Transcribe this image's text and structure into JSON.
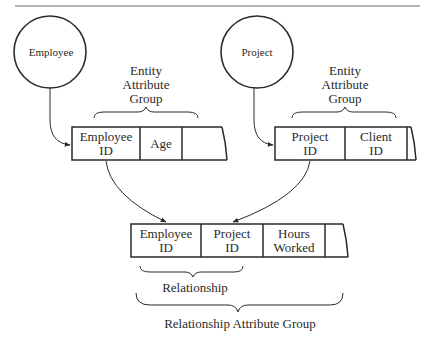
{
  "entities": [
    {
      "name": "Employee"
    },
    {
      "name": "Project"
    }
  ],
  "attribute_group_label": [
    "Entity",
    "Attribute",
    "Group"
  ],
  "employee_table": {
    "cells": [
      [
        "Employee",
        "ID"
      ],
      [
        "Age"
      ],
      []
    ]
  },
  "project_table": {
    "cells": [
      [
        "Project",
        "ID"
      ],
      [
        "Client",
        "ID"
      ]
    ]
  },
  "relationship_table": {
    "cells": [
      [
        "Employee",
        "ID"
      ],
      [
        "Project",
        "ID"
      ],
      [
        "Hours",
        "Worked"
      ]
    ]
  },
  "relationship_label": "Relationship",
  "relationship_attribute_group_label": "Relationship Attribute Group",
  "colors": {
    "stroke": "#2a2a2a",
    "rule": "#999999",
    "background": "#ffffff"
  }
}
